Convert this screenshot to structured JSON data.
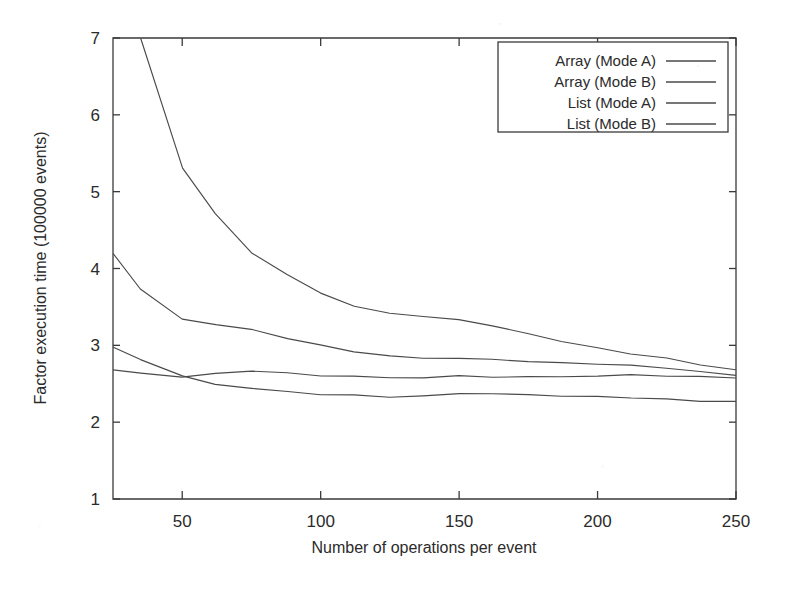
{
  "chart_data": {
    "type": "line",
    "title": "",
    "xlabel": "Number of operations per event",
    "ylabel": "Factor execution time (100000 events)",
    "xlim": [
      25,
      250
    ],
    "ylim": [
      1,
      7
    ],
    "xticks": [
      50,
      100,
      150,
      200,
      250
    ],
    "yticks": [
      1,
      2,
      3,
      4,
      5,
      6,
      7
    ],
    "grid": false,
    "legend_position": "top-right",
    "line_color": "#4a4a4a",
    "x": [
      25,
      35,
      50,
      62,
      75,
      88,
      100,
      112,
      125,
      137,
      150,
      162,
      175,
      187,
      200,
      212,
      225,
      237,
      250
    ],
    "series": [
      {
        "name": "Array (Mode A)",
        "values": [
          9.9,
          7.0,
          5.3,
          4.72,
          4.2,
          3.93,
          3.68,
          3.5,
          3.42,
          3.37,
          3.34,
          3.25,
          3.16,
          3.05,
          2.96,
          2.89,
          2.83,
          2.75,
          2.68
        ],
        "note": "rises above plotted y-range at small x; clipped at y=7"
      },
      {
        "name": "Array (Mode B)",
        "values": [
          4.2,
          3.73,
          3.35,
          3.27,
          3.2,
          3.09,
          3.0,
          2.92,
          2.86,
          2.84,
          2.83,
          2.81,
          2.79,
          2.77,
          2.76,
          2.74,
          2.71,
          2.66,
          2.6
        ]
      },
      {
        "name": "List (Mode A)",
        "values": [
          2.68,
          2.63,
          2.59,
          2.63,
          2.67,
          2.64,
          2.61,
          2.6,
          2.57,
          2.58,
          2.6,
          2.59,
          2.59,
          2.6,
          2.6,
          2.61,
          2.6,
          2.59,
          2.58
        ]
      },
      {
        "name": "List (Mode B)",
        "values": [
          2.97,
          2.82,
          2.6,
          2.5,
          2.44,
          2.39,
          2.36,
          2.35,
          2.33,
          2.34,
          2.38,
          2.37,
          2.35,
          2.34,
          2.33,
          2.32,
          2.3,
          2.28,
          2.27
        ]
      }
    ]
  },
  "axes": {
    "x_title": "Number of operations per event",
    "y_title": "Factor execution time (100000 events)",
    "x_tick_labels": [
      "50",
      "100",
      "150",
      "200",
      "250"
    ],
    "y_tick_labels": [
      "1",
      "2",
      "3",
      "4",
      "5",
      "6",
      "7"
    ]
  },
  "legend": {
    "entries": [
      {
        "label": "Array (Mode A)"
      },
      {
        "label": "Array (Mode B)"
      },
      {
        "label": "List (Mode A)"
      },
      {
        "label": "List (Mode B)"
      }
    ]
  }
}
